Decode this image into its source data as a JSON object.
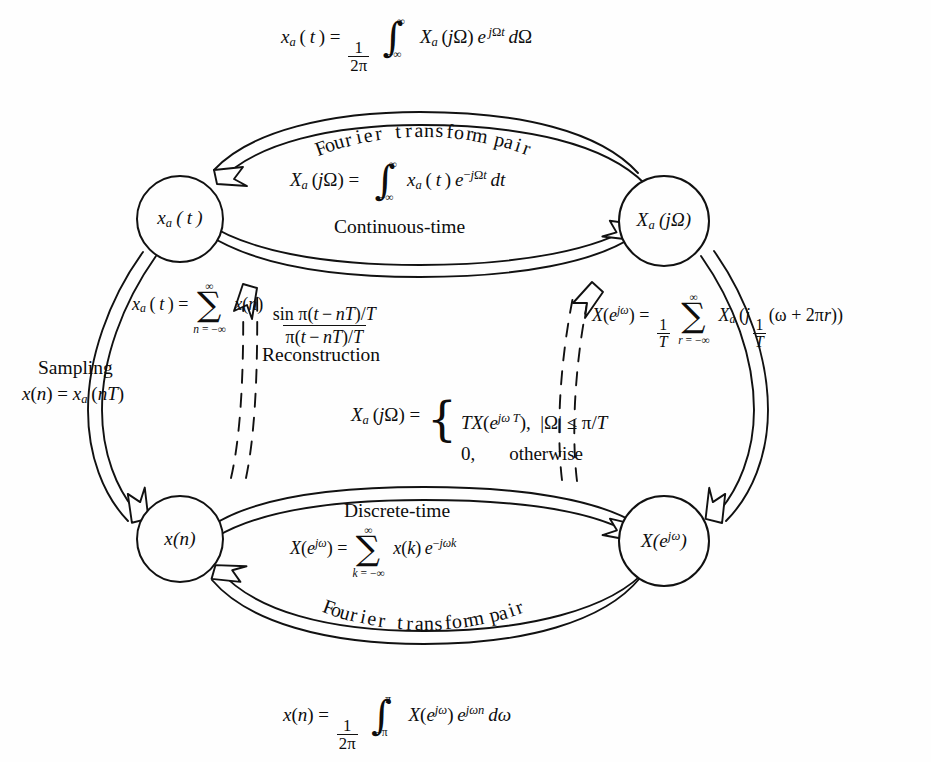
{
  "figure": {
    "type": "signal-processing relationship diagram",
    "nodes": [
      {
        "id": "xa_t",
        "label": "xₐ(t)",
        "position": "top-left"
      },
      {
        "id": "Xa_jw",
        "label": "Xₐ(jΩ)",
        "position": "top-right"
      },
      {
        "id": "x_n",
        "label": "x(n)",
        "position": "bottom-left"
      },
      {
        "id": "X_ejw",
        "label": "X(e^{jω})",
        "position": "bottom-right"
      }
    ],
    "edge_labels": {
      "top_pair": "Fourier transform pair",
      "continuous_time": "Continuous-time",
      "sampling": "Sampling",
      "reconstruction": "Reconstruction",
      "discrete_time": "Discrete-time",
      "bottom_pair": "Fourier transform pair"
    },
    "equations": {
      "inverse_ctft": "x_a(t) = (1/2π) ∫_{-∞}^{∞} X_a(jΩ) e^{jΩt} dΩ",
      "ctft": "X_a(jΩ) = ∫_{-∞}^{∞} x_a(t) e^{-jΩt} dt",
      "reconstruction": "x_a(t) = Σ_{n=-∞}^{∞} x(n) sin π(t-nT)/T ÷ π(t-nT)/T",
      "sampling": "x(n) = x_a(nT)",
      "aliasing": "X(e^{jω}) = (1/T) Σ_{r=-∞}^{∞} X_a(j(1/T)(ω + 2πr))",
      "bandlimited": "X_a(jΩ) = { TX(e^{jωT}), |Ω| ≤ π/T ; 0, otherwise }",
      "dtft": "X(e^{jω}) = Σ_{k=-∞}^{∞} x(k) e^{-jωk}",
      "inverse_dtft": "x(n) = (1/2π) ∫_{-π}^{π} X(e^{jω}) e^{jωn} dω"
    },
    "curved_labels": {
      "top_pair_chars": [
        "F",
        "o",
        "u",
        "r",
        "i",
        "e",
        "r",
        " ",
        "t",
        "r",
        "a",
        "n",
        "s",
        "f",
        "o",
        "r",
        "m",
        " ",
        "p",
        "a",
        "i",
        "r"
      ],
      "bottom_pair_chars": [
        "F",
        "o",
        "u",
        "r",
        "i",
        "e",
        "r",
        " ",
        "t",
        "r",
        "a",
        "n",
        "s",
        "f",
        "o",
        "r",
        "m",
        " ",
        "p",
        "a",
        "i",
        "r"
      ]
    },
    "colors": {
      "ink": "#0d0d0d",
      "paper": "#fefefe",
      "stroke": "#111111"
    }
  }
}
